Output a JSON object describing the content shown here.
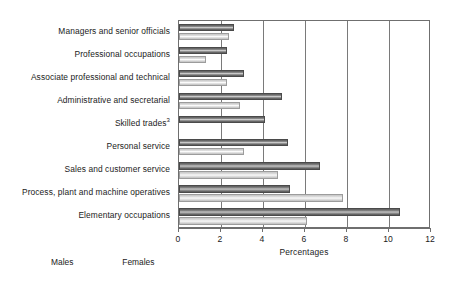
{
  "chart_data": {
    "type": "bar",
    "orientation": "horizontal",
    "title": "",
    "xlabel": "Percentages",
    "ylabel": "",
    "xlim": [
      0,
      12
    ],
    "xticks": [
      0,
      2,
      4,
      6,
      8,
      10,
      12
    ],
    "xticklabels": [
      "0",
      "2",
      "4",
      "6",
      "8",
      "10",
      "12"
    ],
    "grid": "vertical",
    "legend_position": "bottom-left",
    "categories": [
      "Managers and senior officials",
      "Professional occupations",
      "Associate professional and technical",
      "Administrative and secretarial",
      "Skilled trades",
      "Personal service",
      "Sales and customer service",
      "Process, plant and machine operatives",
      "Elementary occupations"
    ],
    "category_footnotes": [
      "",
      "",
      "",
      "",
      "3",
      "",
      "",
      "",
      ""
    ],
    "series": [
      {
        "name": "Males",
        "color": "#6d6d6d",
        "values": [
          2.6,
          2.3,
          3.1,
          4.9,
          4.1,
          5.2,
          6.7,
          5.3,
          10.5
        ]
      },
      {
        "name": "Females",
        "color": "#dcdcdc",
        "values": [
          2.4,
          1.3,
          2.3,
          2.9,
          0.0,
          3.1,
          4.7,
          7.8,
          6.1
        ]
      }
    ]
  }
}
